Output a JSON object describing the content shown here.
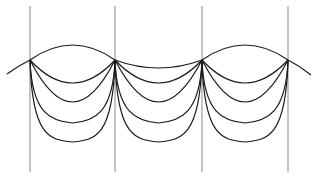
{
  "diagram": {
    "title": "",
    "supports": {
      "count": 4,
      "color": "#8a8a8a"
    },
    "spans": [
      {
        "top_shape": "arch",
        "hanging_curves": 4
      },
      {
        "top_shape": "sag",
        "hanging_curves": 4
      },
      {
        "top_shape": "arch",
        "hanging_curves": 4
      }
    ],
    "hanging_curve_shapes": [
      "round",
      "round",
      "slightly-pointed",
      "pointed"
    ],
    "curve_color": "#1a1a1a"
  }
}
